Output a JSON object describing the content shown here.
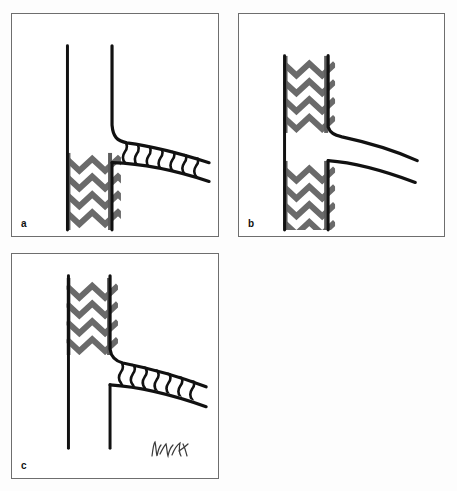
{
  "figure": {
    "background_color": "#fdfdfd",
    "panel_border_color": "#6e6e6e",
    "vessel_line_color": "#111111",
    "aortic_stent_color": "#6a6a6a",
    "branch_stent_color": "#111111",
    "panel_count": 3
  },
  "panels": [
    {
      "id": "a",
      "label": "a",
      "position": "top-left",
      "caption": "Aortic stent graft distal segment with stented branch vessel directed downward",
      "elements": {
        "aorta_wall_left": "vertical-line",
        "aorta_wall_right": "vertical-line-with-downward-curve",
        "aortic_stent": "zigzag-z-stent",
        "aortic_stent_position": "lower",
        "branch_vessel": "downward-curving-branch",
        "branch_stent": "wavy-rib-stent",
        "branch_stent_present": true
      }
    },
    {
      "id": "b",
      "label": "b",
      "position": "top-right",
      "caption": "Two separate aortic stent graft segments with unstented bare branch vessels",
      "elements": {
        "aorta_wall_left": "vertical-line",
        "aorta_wall_right": "vertical-line-segmented",
        "aortic_stent": "zigzag-z-stent",
        "aortic_stent_position": "upper-and-lower",
        "aortic_stent_count": 2,
        "branch_vessel": "two-downward-curving-bare-branches",
        "branch_stent": "none",
        "branch_stent_present": false
      }
    },
    {
      "id": "c",
      "label": "c",
      "position": "bottom-left",
      "caption": "Aortic stent graft proximal segment with stented branch vessel and long distal aorta",
      "elements": {
        "aorta_wall_left": "vertical-line-long",
        "aorta_wall_right": "vertical-line-with-downward-curve",
        "aortic_stent": "zigzag-z-stent",
        "aortic_stent_position": "upper",
        "branch_vessel": "downward-curving-branch",
        "branch_stent": "wavy-rib-stent",
        "branch_stent_present": true,
        "signature": "artist-signature"
      }
    }
  ],
  "annotations": {
    "signature_present": true,
    "signature_panel": "c",
    "signature_name": "signature-icon"
  }
}
